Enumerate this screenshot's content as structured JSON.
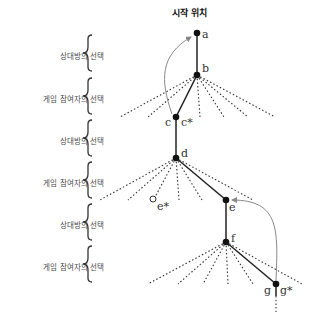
{
  "title": "시작 위치",
  "levels": [
    {
      "label": "상대방의 선택",
      "top": 50
    },
    {
      "label": "게임 참여자의 선택",
      "top": 93
    },
    {
      "label": "상대방의 선택",
      "top": 135
    },
    {
      "label": "게임 참여자의 선택",
      "top": 177
    },
    {
      "label": "상대방의 선택",
      "top": 219
    },
    {
      "label": "게임 참여자의 선택",
      "top": 261
    }
  ],
  "nodes": {
    "a": "a",
    "b": "b",
    "c": "c",
    "c_star": "c*",
    "d": "d",
    "e": "e",
    "e_star": "e*",
    "f": "f",
    "g": "g",
    "g_star": "g*"
  },
  "colors": {
    "edge": "#222222",
    "arrow": "#888888",
    "dotted": "#333333"
  }
}
